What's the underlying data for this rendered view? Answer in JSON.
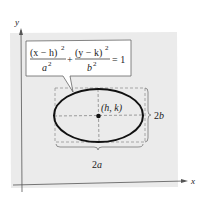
{
  "diagram": {
    "axes": {
      "x_label": "x",
      "y_label": "y"
    },
    "equation": {
      "term1_num": "(x − h)",
      "term1_den": "a",
      "term2_num": "(y − k)",
      "term2_den": "b",
      "exponent": "2",
      "plus": "+",
      "equals": "= 1"
    },
    "center_label": "(h, k)",
    "width_label": "2a",
    "height_label": "2b",
    "colors": {
      "background_panel": "#ebebeb",
      "ellipse": "#111111",
      "axes": "#555555",
      "dashed": "#777777"
    }
  }
}
